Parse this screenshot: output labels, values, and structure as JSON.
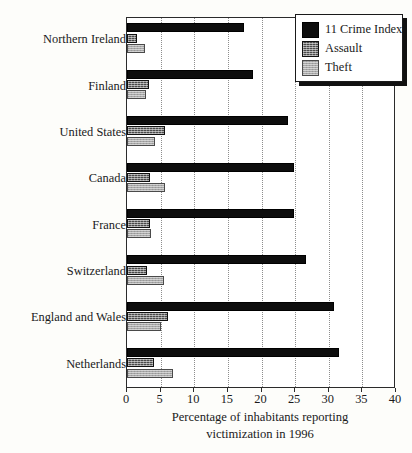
{
  "chart_data": {
    "type": "bar",
    "orientation": "horizontal",
    "title": "",
    "subtitle": "",
    "xlabel": "Percentage of inhabitants reporting victimization in 1996",
    "xlabel_lines": [
      "Percentage of inhabitants reporting",
      "victimization in 1996"
    ],
    "ylabel": "",
    "xlim": [
      0,
      40
    ],
    "xticks": [
      0,
      5,
      10,
      15,
      20,
      25,
      30,
      35,
      40
    ],
    "xtick_labels": [
      "0",
      "5",
      "10",
      "15",
      "20",
      "25",
      "30",
      "35",
      "40"
    ],
    "grid": "vertical-dotted",
    "legend_position": "top-right",
    "categories": [
      "Northern Ireland",
      "Finland",
      "United States",
      "Canada",
      "France",
      "Switzerland",
      "England and Wales",
      "Netherlands"
    ],
    "series": [
      {
        "name": "11 Crime Index",
        "color": "#0d0d0d",
        "values": [
          17.4,
          18.8,
          24.0,
          24.9,
          24.9,
          26.6,
          30.8,
          31.5
        ]
      },
      {
        "name": "Assault",
        "color": "#4a4a4a",
        "values": [
          1.5,
          3.3,
          5.7,
          3.4,
          3.4,
          2.9,
          6.1,
          4.0
        ]
      },
      {
        "name": "Theft",
        "color": "#a8a8a8",
        "values": [
          2.7,
          2.8,
          4.1,
          5.6,
          3.6,
          5.5,
          5.0,
          6.9
        ]
      }
    ]
  },
  "legend": {
    "items": [
      {
        "label": "11 Crime Index",
        "swatch": "crime"
      },
      {
        "label": "Assault",
        "swatch": "assault"
      },
      {
        "label": "Theft",
        "swatch": "theft"
      }
    ]
  },
  "colors": {
    "crime_index": "#0d0d0d",
    "assault": "#4a4a4a",
    "theft": "#a8a8a8",
    "axis": "#2b2b2b",
    "gridline": "#8d8d8d",
    "plot_background": "#ffffff",
    "page_background": "#fdfdfa"
  }
}
